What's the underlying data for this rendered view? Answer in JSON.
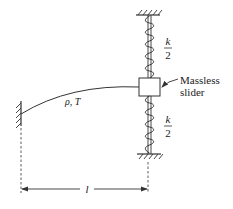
{
  "diagram": {
    "string_label": "ρ, T",
    "spring_top": {
      "numerator": "k",
      "denominator": "2"
    },
    "spring_bottom": {
      "numerator": "k",
      "denominator": "2"
    },
    "slider_label_line1": "Massless",
    "slider_label_line2": "slider",
    "length_label": "l"
  },
  "colors": {
    "stroke": "#333333",
    "background": "#ffffff"
  }
}
